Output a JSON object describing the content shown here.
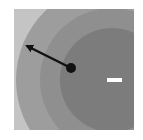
{
  "diagram": {
    "type": "electric-field-potential",
    "panel": {
      "x": 14,
      "y": 9,
      "w": 120,
      "h": 121,
      "fill": "#c4c4c4"
    },
    "center": {
      "x": 112,
      "y": 80
    },
    "rings": [
      {
        "r": 96,
        "fill": "#9d9d9d"
      },
      {
        "r": 72,
        "fill": "#8f8f8f"
      },
      {
        "r": 52,
        "fill": "#7c7c7c"
      }
    ],
    "charge": {
      "label": "-",
      "x": 107,
      "y": 78,
      "w": 15,
      "h": 4,
      "color": "#ffffff"
    },
    "particle": {
      "x": 71,
      "y": 68,
      "r": 5,
      "color": "#111111"
    },
    "arrow": {
      "x1": 71,
      "y1": 68,
      "x2": 27,
      "y2": 46,
      "color": "#111111"
    }
  }
}
